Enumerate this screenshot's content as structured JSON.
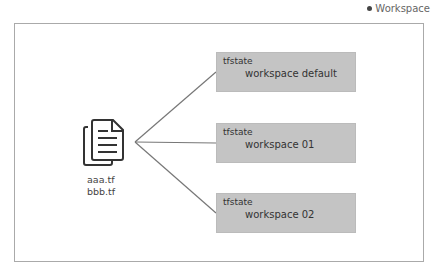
{
  "legend": {
    "label": "Workspace"
  },
  "files": {
    "icon": "document-copy-icon",
    "names": [
      "aaa.tf",
      "bbb.tf"
    ]
  },
  "states": [
    {
      "title": "tfstate",
      "workspace": "workspace default"
    },
    {
      "title": "tfstate",
      "workspace": "workspace 01"
    },
    {
      "title": "tfstate",
      "workspace": "workspace 02"
    }
  ],
  "colors": {
    "box_fill": "#c4c4c4",
    "line": "#777777",
    "frame": "#aaaaaa"
  }
}
